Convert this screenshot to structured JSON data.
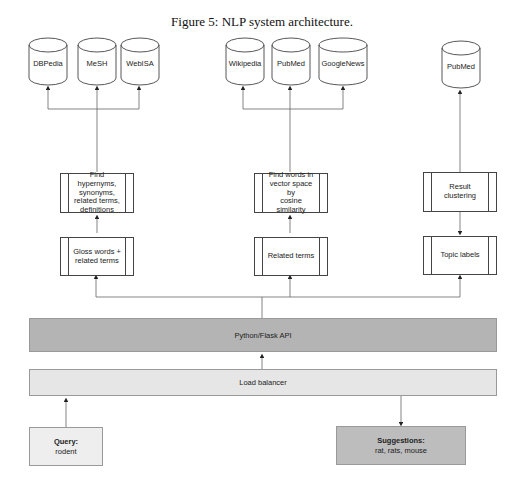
{
  "caption": "Figure 5: NLP system architecture.",
  "databases": {
    "group1": [
      {
        "label": "DBPedia"
      },
      {
        "label": "MeSH"
      },
      {
        "label": "WebISA"
      }
    ],
    "group2": [
      {
        "label": "Wikipedia"
      },
      {
        "label": "PubMed"
      },
      {
        "label": "GoogleNews"
      }
    ],
    "group3": [
      {
        "label": "PubMed"
      }
    ]
  },
  "processes": {
    "left_upper": "Find hypernyms,\nsynonyms,\nrelated terms,\ndefinitions",
    "left_lower": "Gloss words +\nrelated terms",
    "mid_upper": "Find words in\nvector space by\ncosine similarity",
    "mid_lower": "Related terms",
    "right_upper": "Result clustering",
    "right_lower": "Topic labels"
  },
  "api_label": "Python/Flask API",
  "load_balancer_label": "Load balancer",
  "query": {
    "title": "Query:",
    "value": "rodent"
  },
  "suggestions": {
    "title": "Suggestions:",
    "value": "rat, rats, mouse"
  },
  "colors": {
    "api_fill": "#b4b4b4",
    "load_balancer_fill": "#e6e6e6",
    "query_fill": "#eeeeee",
    "suggestions_fill": "#bdbdbd",
    "line": "#555555"
  }
}
